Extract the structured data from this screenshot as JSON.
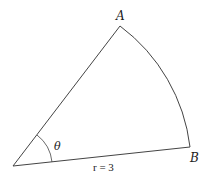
{
  "diagram": {
    "type": "circular-sector",
    "labels": {
      "point_a": "A",
      "point_b": "B",
      "angle": "θ",
      "radius": "r = 3"
    },
    "colors": {
      "stroke": "#444444",
      "text": "#222222",
      "background": "#ffffff"
    }
  }
}
